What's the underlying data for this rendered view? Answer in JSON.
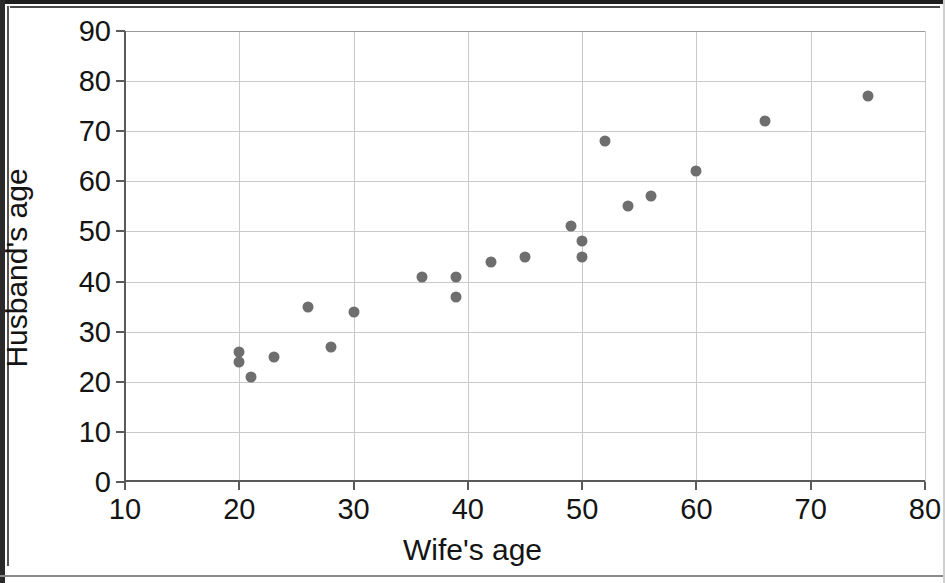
{
  "chart_data": {
    "type": "scatter",
    "title": "",
    "xlabel": "Wife's age",
    "ylabel": "Husband's age",
    "xlim": [
      10,
      80
    ],
    "ylim": [
      0,
      90
    ],
    "xticks": [
      10,
      20,
      30,
      40,
      50,
      60,
      70,
      80
    ],
    "yticks": [
      0,
      10,
      20,
      30,
      40,
      50,
      60,
      70,
      80,
      90
    ],
    "grid": true,
    "legend": null,
    "marker_color": "#6e6e6e",
    "points": [
      {
        "x": 20,
        "y": 26
      },
      {
        "x": 20,
        "y": 24
      },
      {
        "x": 21,
        "y": 21
      },
      {
        "x": 23,
        "y": 25
      },
      {
        "x": 26,
        "y": 35
      },
      {
        "x": 28,
        "y": 27
      },
      {
        "x": 30,
        "y": 34
      },
      {
        "x": 36,
        "y": 41
      },
      {
        "x": 39,
        "y": 41
      },
      {
        "x": 39,
        "y": 37
      },
      {
        "x": 42,
        "y": 44
      },
      {
        "x": 45,
        "y": 45
      },
      {
        "x": 49,
        "y": 51
      },
      {
        "x": 50,
        "y": 48
      },
      {
        "x": 50,
        "y": 45
      },
      {
        "x": 52,
        "y": 68
      },
      {
        "x": 54,
        "y": 55
      },
      {
        "x": 56,
        "y": 57
      },
      {
        "x": 60,
        "y": 62
      },
      {
        "x": 66,
        "y": 72
      },
      {
        "x": 75,
        "y": 77
      }
    ]
  }
}
